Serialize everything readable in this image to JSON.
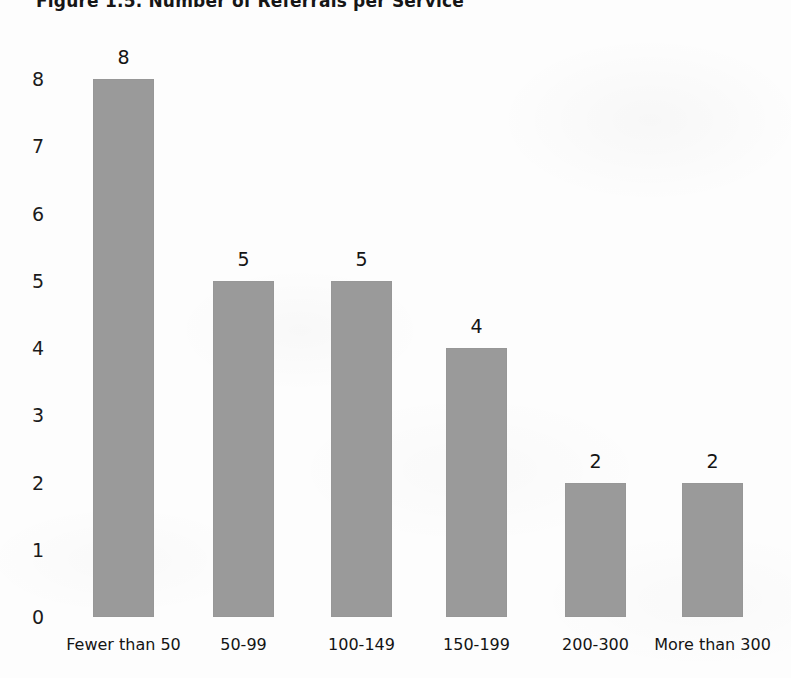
{
  "figure": {
    "title": "Figure 1.5. Number of Referrals per Service"
  },
  "chart_data": {
    "type": "bar",
    "title": "Figure 1.5. Number of Referrals per Service",
    "xlabel": "",
    "ylabel": "",
    "categories": [
      "Fewer than 50",
      "50-99",
      "100-149",
      "150-199",
      "200-300",
      "More than 300"
    ],
    "values": [
      8,
      5,
      5,
      4,
      2,
      2
    ],
    "data_labels": [
      "8",
      "5",
      "5",
      "4",
      "2",
      "2"
    ],
    "ylim": [
      0,
      8
    ],
    "yticks": [
      0,
      1,
      2,
      3,
      4,
      5,
      6,
      7,
      8
    ],
    "ytick_labels": [
      "0",
      "1",
      "2",
      "3",
      "4",
      "5",
      "6",
      "7",
      "8"
    ],
    "grid": false,
    "legend": null,
    "bar_color": "#9a9a9a",
    "background_color": "#fdfdfd",
    "text_color": "#141414"
  }
}
